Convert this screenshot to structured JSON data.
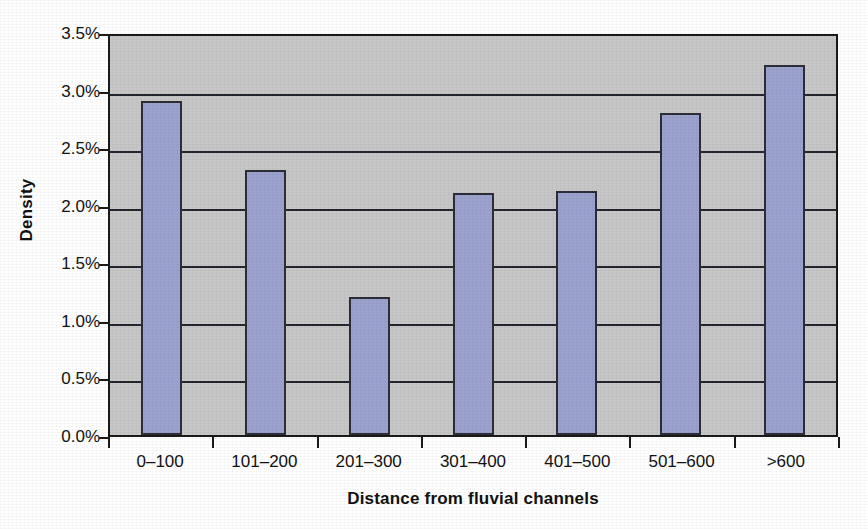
{
  "chart_data": {
    "type": "bar",
    "title": "",
    "subtitle": "",
    "xlabel": "Distance from fluvial channels",
    "ylabel": "Density",
    "categories": [
      "0–100",
      "101–200",
      "201–300",
      "301–400",
      "401–500",
      "501–600",
      ">600"
    ],
    "values": [
      2.9,
      2.3,
      1.2,
      2.1,
      2.12,
      2.8,
      3.21
    ],
    "value_labels": [
      "2.9%",
      "2.3%",
      "1.2%",
      "2.1%",
      "2.12%",
      "2.8%",
      "3.21%"
    ],
    "ylim": [
      0,
      3.5
    ],
    "ytick_values": [
      0.0,
      0.5,
      1.0,
      1.5,
      2.0,
      2.5,
      3.0,
      3.5
    ],
    "ytick_labels": [
      "0.0%",
      "0.5%",
      "1.0%",
      "1.5%",
      "2.0%",
      "2.5%",
      "3.0%",
      "3.5%"
    ],
    "grid": "horizontal",
    "legend": "none",
    "bar_color": "#9ba2cd",
    "bar_border_color": "#2b2e38",
    "plot_background": "#c7c7c7",
    "axis_color": "#1a1a1a",
    "figure_background": "#ffffff"
  }
}
